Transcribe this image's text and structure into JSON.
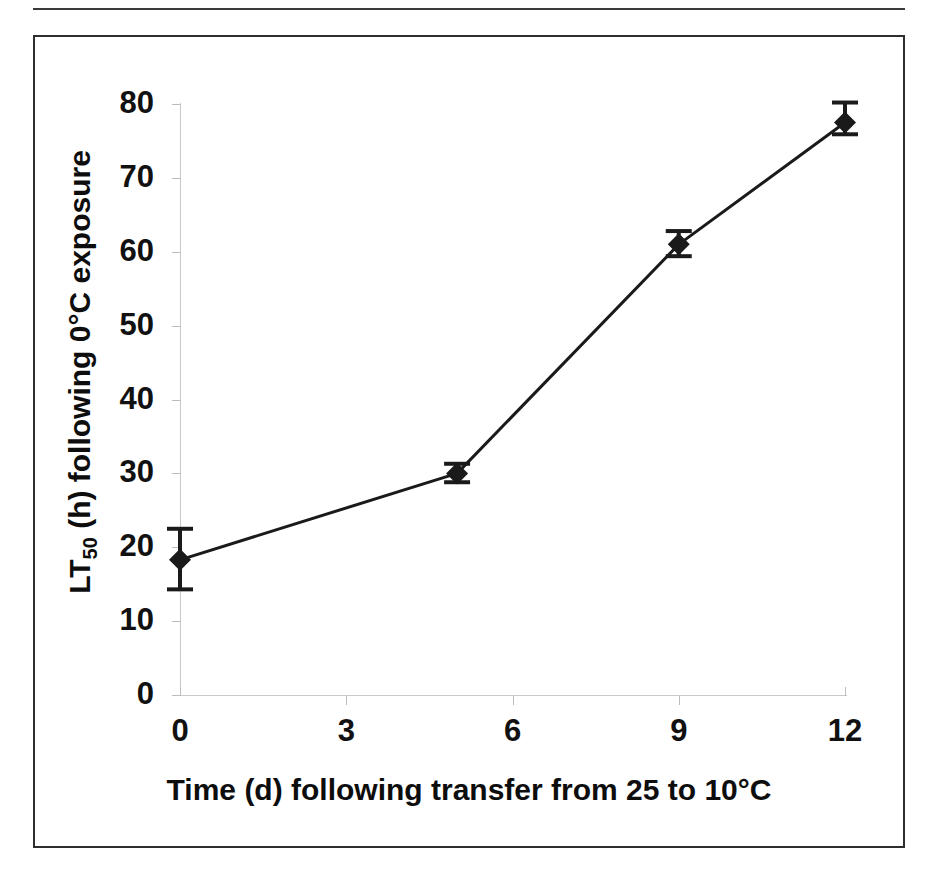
{
  "figure": {
    "has_top_rule": true,
    "frame_border_color": "#2e2e2e",
    "background_color": "#ffffff"
  },
  "chart_data": {
    "type": "line",
    "title": "",
    "subtitle": "",
    "xlabel": "Time (d) following transfer from 25 to 10°C",
    "ylabel_prefix": "LT",
    "ylabel_sub": "50",
    "ylabel_suffix": " (h) following 0°C exposure",
    "ylabel_plain": "LT50 (h) following 0°C exposure",
    "x": [
      0,
      5,
      9,
      12
    ],
    "values": [
      18.3,
      30.0,
      61.0,
      77.5
    ],
    "error_low": [
      14.3,
      28.8,
      59.4,
      75.9
    ],
    "error_high": [
      22.5,
      31.3,
      62.8,
      80.2
    ],
    "series": [
      {
        "name": "LT50",
        "x": [
          0,
          5,
          9,
          12
        ],
        "values": [
          18.3,
          30.0,
          61.0,
          77.5
        ],
        "error_low": [
          14.3,
          28.8,
          59.4,
          75.9
        ],
        "error_high": [
          22.5,
          31.3,
          62.8,
          80.2
        ],
        "marker": "filled-diamond",
        "line_color": "#1a1a1a",
        "marker_color": "#1a1a1a"
      }
    ],
    "xlim": [
      0,
      12
    ],
    "ylim": [
      0,
      80
    ],
    "xticks": [
      0,
      3,
      6,
      9,
      12
    ],
    "yticks": [
      0,
      10,
      20,
      30,
      40,
      50,
      60,
      70,
      80
    ],
    "xtick_labels": [
      "0",
      "3",
      "6",
      "9",
      "12"
    ],
    "ytick_labels": [
      "0",
      "10",
      "20",
      "30",
      "40",
      "50",
      "60",
      "70",
      "80"
    ],
    "grid": false,
    "legend": false,
    "legend_position": "none",
    "error_bars": true,
    "axis_color": "#c9c9c9",
    "tick_color": "#bdbdbd",
    "text_color": "#111111"
  }
}
